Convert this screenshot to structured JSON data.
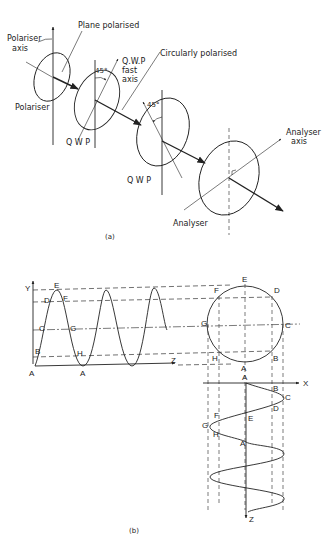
{
  "figure_a": {
    "caption": "(a)",
    "labels": {
      "polariser_axis_1": "Polariser",
      "polariser_axis_2": "axis",
      "plane_polarised": "Plane  polarised",
      "polariser": "Polariser",
      "angle1": "45°",
      "qwp_fast_1": "Q.W.P",
      "qwp_fast_2": "fast",
      "qwp_fast_3": "axis",
      "circularly_polarised": "Circularly polarised",
      "qwp1": "Q W P",
      "angle2": "45°",
      "qwp2": "Q W P",
      "analyser_axis_1": "Analyser",
      "analyser_axis_2": "axis",
      "analyser": "Analyser"
    }
  },
  "figure_b": {
    "caption": "(b)",
    "axes": {
      "y": "Y",
      "z1": "Z",
      "x": "X",
      "z2": "Z"
    },
    "wave_points": [
      "A",
      "B",
      "C",
      "D",
      "E",
      "F",
      "G",
      "H",
      "A"
    ],
    "circle_points": [
      "E",
      "D",
      "C",
      "B",
      "A",
      "H",
      "G",
      "F"
    ],
    "lower_wave_points": [
      "A",
      "B",
      "C",
      "D",
      "E",
      "F",
      "G",
      "H",
      "A"
    ]
  }
}
